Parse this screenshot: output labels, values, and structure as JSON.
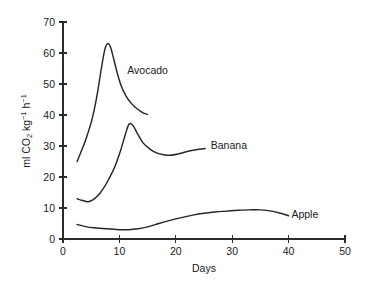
{
  "chart_data": {
    "type": "line",
    "title": "",
    "xlabel": "Days",
    "ylabel": "ml CO2 kg-1 h-1",
    "ylabel_parts": {
      "prefix": "ml CO",
      "sub1": "2",
      "mid": " kg",
      "sup1": "−1",
      "mid2": " h",
      "sup2": "−1"
    },
    "xlim": [
      0,
      50
    ],
    "ylim": [
      0,
      70
    ],
    "xticks": [
      0,
      10,
      20,
      30,
      40,
      50
    ],
    "yticks": [
      0,
      10,
      20,
      30,
      40,
      50,
      60,
      70
    ],
    "xtick_labels": [
      "0",
      "10",
      "20",
      "30",
      "40",
      "50"
    ],
    "ytick_labels": [
      "0",
      "10",
      "20",
      "30",
      "40",
      "50",
      "60",
      "70"
    ],
    "grid": false,
    "legend_position": "inline-annotations",
    "line_color": "#262626",
    "series": [
      {
        "name": "Avocado",
        "label_x": 11.4,
        "label_y": 54.5,
        "x": [
          2.5,
          3.4,
          4.3,
          5.2,
          6.0,
          6.8,
          7.4,
          7.9,
          8.4,
          9.0,
          9.7,
          10.4,
          11.2,
          12.0,
          12.8,
          13.6,
          14.3,
          15.0
        ],
        "values": [
          25.0,
          29.0,
          33.5,
          39.0,
          46.0,
          55.0,
          61.0,
          63.0,
          62.0,
          58.0,
          53.0,
          49.0,
          46.0,
          44.0,
          42.5,
          41.4,
          40.6,
          40.2
        ]
      },
      {
        "name": "Banana",
        "label_x": 26.2,
        "label_y": 30.2,
        "x": [
          2.5,
          3.5,
          4.4,
          5.3,
          6.2,
          7.2,
          8.2,
          9.2,
          10.2,
          11.0,
          11.7,
          12.4,
          13.2,
          14.2,
          15.4,
          16.6,
          17.8,
          19.0,
          20.4,
          22.0,
          23.6,
          25.2
        ],
        "values": [
          13.0,
          12.4,
          12.0,
          12.6,
          14.0,
          16.4,
          19.6,
          23.4,
          28.5,
          33.4,
          37.0,
          36.6,
          34.0,
          31.0,
          29.0,
          27.8,
          27.2,
          27.0,
          27.4,
          28.2,
          28.8,
          29.2
        ]
      },
      {
        "name": "Apple",
        "label_x": 40.5,
        "label_y": 8.0,
        "x": [
          2.5,
          4.0,
          5.5,
          7.0,
          8.5,
          10.0,
          11.5,
          13.0,
          15.0,
          17.0,
          19.0,
          21.0,
          23.0,
          25.0,
          27.0,
          29.0,
          31.0,
          33.0,
          35.0,
          37.0,
          38.6,
          40.0
        ],
        "values": [
          4.7,
          4.0,
          3.6,
          3.4,
          3.2,
          3.0,
          3.0,
          3.2,
          3.9,
          5.0,
          6.0,
          6.9,
          7.7,
          8.3,
          8.7,
          9.0,
          9.3,
          9.4,
          9.4,
          9.0,
          8.3,
          7.5
        ]
      }
    ]
  }
}
